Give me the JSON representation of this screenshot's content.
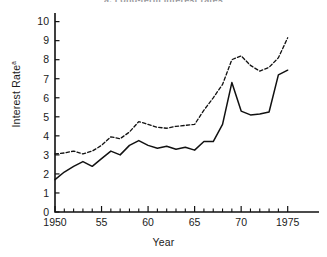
{
  "chart_data": {
    "type": "line",
    "title": "a. Long-term interest rates",
    "xlabel": "Year",
    "ylabel": "Interest Rate",
    "ylabel_superscript": "a",
    "xlim": [
      1950,
      1976
    ],
    "ylim": [
      0,
      10.4
    ],
    "grid": false,
    "legend": "none",
    "y_ticks": [
      "0",
      "1",
      "2",
      "3",
      "4",
      "5",
      "6",
      "7",
      "8",
      "9",
      "10"
    ],
    "y_tick_values": [
      0,
      1,
      2,
      3,
      4,
      5,
      6,
      7,
      8,
      9,
      10
    ],
    "x_ticks": [
      "1950",
      "55",
      "60",
      "65",
      "70",
      "1975"
    ],
    "x_tick_values": [
      1950,
      1955,
      1960,
      1965,
      1970,
      1975
    ],
    "x_minor_step": 1,
    "x": [
      1950,
      1951,
      1952,
      1953,
      1954,
      1955,
      1956,
      1957,
      1958,
      1959,
      1960,
      1961,
      1962,
      1963,
      1964,
      1965,
      1966,
      1967,
      1968,
      1969,
      1970,
      1971,
      1972,
      1973,
      1974,
      1975
    ],
    "series": [
      {
        "name": "Government bond yield",
        "style": "solid",
        "color": "#111111",
        "values": [
          1.7,
          2.1,
          2.4,
          2.65,
          2.4,
          2.8,
          3.2,
          3.0,
          3.5,
          3.75,
          3.5,
          3.35,
          3.45,
          3.3,
          3.4,
          3.25,
          3.7,
          3.7,
          4.6,
          6.8,
          5.3,
          5.1,
          5.15,
          5.25,
          7.2,
          7.45
        ]
      },
      {
        "name": "Corporate bond yield",
        "style": "dashed",
        "color": "#111111",
        "values": [
          3.05,
          3.1,
          3.2,
          3.05,
          3.2,
          3.5,
          3.95,
          3.85,
          4.2,
          4.75,
          4.6,
          4.45,
          4.4,
          4.5,
          4.55,
          4.6,
          5.35,
          6.0,
          6.7,
          8.0,
          8.2,
          7.7,
          7.4,
          7.6,
          8.1,
          9.15
        ]
      }
    ]
  }
}
